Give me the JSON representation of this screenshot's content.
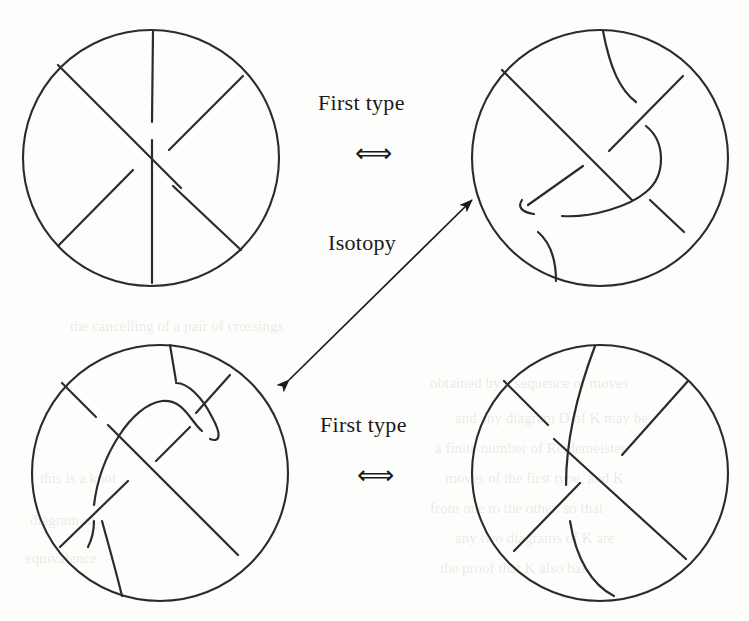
{
  "figure": {
    "background_color": "#fdfdfb",
    "ink_color": "#2b2b2b"
  },
  "labels": {
    "first_type_top": "First type",
    "first_type_bottom": "First type",
    "isotopy": "Isotopy",
    "equivalence_arrow_top": "⟺",
    "equivalence_arrow_bottom": "⟺"
  },
  "panels": [
    {
      "id": "top-left",
      "name": "tangle-diagram-top-left",
      "description": "Tangle disk with a straight vertical strand and two crossing diagonal strands, no kink",
      "center_x": 151,
      "center_y": 158,
      "radius": 130,
      "has_kink": false
    },
    {
      "id": "top-right",
      "name": "tangle-diagram-top-right",
      "description": "Tangle disk with an S-shaped curled strand forming a kink, plus two crossing diagonal strands",
      "center_x": 600,
      "center_y": 158,
      "radius": 130,
      "has_kink": true
    },
    {
      "id": "bottom-left",
      "name": "tangle-diagram-bottom-left",
      "description": "Rotated tangle disk with curled kink strand and crossing diagonals",
      "center_x": 160,
      "center_y": 473,
      "radius": 130,
      "has_kink": true
    },
    {
      "id": "bottom-right",
      "name": "tangle-diagram-bottom-right",
      "description": "Tangle disk with a single smooth curved strand and two crossing diagonal strands, no kink",
      "center_x": 600,
      "center_y": 473,
      "radius": 130,
      "has_kink": false
    }
  ],
  "arrows": {
    "isotopy_arrow": {
      "name": "isotopy-double-arrow",
      "from_x": 287,
      "from_y": 379,
      "to_x": 472,
      "to_y": 198,
      "double_headed": true
    }
  },
  "background_watermark": [
    {
      "text": "the cancelling of a pair of crossings",
      "x": 70,
      "y": 318
    },
    {
      "text": "obtained by a sequence of moves",
      "x": 430,
      "y": 375
    },
    {
      "text": "and any diagram D of K may be",
      "x": 455,
      "y": 410
    },
    {
      "text": "a finite number of Reidemeister",
      "x": 435,
      "y": 440
    },
    {
      "text": "moves of the first type, and K",
      "x": 445,
      "y": 470
    },
    {
      "text": "from one to the other, so that",
      "x": 430,
      "y": 500
    },
    {
      "text": "any two diagrams of K are",
      "x": 455,
      "y": 530
    },
    {
      "text": "the proof that K also has",
      "x": 440,
      "y": 560
    },
    {
      "text": "this is a knot",
      "x": 40,
      "y": 470
    },
    {
      "text": "diagram of",
      "x": 30,
      "y": 512
    },
    {
      "text": "equivalence",
      "x": 25,
      "y": 550
    }
  ]
}
